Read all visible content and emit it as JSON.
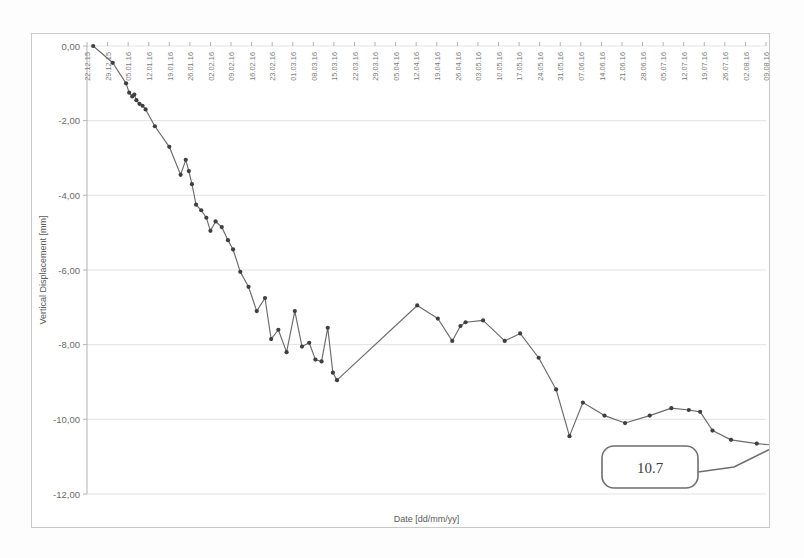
{
  "chart_data": {
    "type": "line",
    "title": "",
    "xlabel": "Date [dd/mm/yy]",
    "ylabel": "Vertical Displacement [mm]",
    "ylim": [
      -12.0,
      0.0
    ],
    "ytick_labels": [
      "0,00",
      "-2,00",
      "-4,00",
      "-6,00",
      "-8,00",
      "-10,00",
      "-12,00"
    ],
    "ytick_values": [
      0.0,
      -2.0,
      -4.0,
      -6.0,
      -8.0,
      -10.0,
      -12.0
    ],
    "grid": true,
    "legend": null,
    "xtick_labels": [
      "22.12.15",
      "29.12.15",
      "05.01.16",
      "12.01.16",
      "19.01.16",
      "26.01.16",
      "02.02.16",
      "09.02.16",
      "16.02.16",
      "23.02.16",
      "01.03.16",
      "08.03.16",
      "15.03.16",
      "22.03.16",
      "29.03.16",
      "05.04.16",
      "12.04.16",
      "19.04.16",
      "26.04.16",
      "03.05.16",
      "10.05.16",
      "17.05.16",
      "24.05.16",
      "31.05.16",
      "07.06.16",
      "14.06.16",
      "21.06.16",
      "28.06.16",
      "05.07.16",
      "12.07.16",
      "19.07.16",
      "26.07.16",
      "02.08.16",
      "09.08.16"
    ],
    "series": [
      {
        "name": "Vertical Displacement",
        "x": [
          0.3,
          1.25,
          1.9,
          2.05,
          2.2,
          2.3,
          2.4,
          2.55,
          2.7,
          2.85,
          3.3,
          4.0,
          4.55,
          4.8,
          4.95,
          5.1,
          5.3,
          5.55,
          5.8,
          6.0,
          6.25,
          6.55,
          6.85,
          7.1,
          7.45,
          7.85,
          8.25,
          8.65,
          8.95,
          9.3,
          9.7,
          10.1,
          10.45,
          10.8,
          11.1,
          11.4,
          11.7,
          11.95,
          12.15,
          16.05,
          17.05,
          17.75,
          18.15,
          18.4,
          19.25,
          20.3,
          21.05,
          21.95,
          22.8,
          23.45,
          24.1,
          25.15,
          26.15,
          27.35,
          28.4,
          29.25,
          29.8,
          30.4,
          31.3,
          32.55,
          33.55
        ],
        "values": [
          0.0,
          -0.45,
          -1.0,
          -1.25,
          -1.35,
          -1.3,
          -1.45,
          -1.55,
          -1.6,
          -1.7,
          -2.15,
          -2.7,
          -3.45,
          -3.05,
          -3.35,
          -3.7,
          -4.25,
          -4.4,
          -4.6,
          -4.95,
          -4.7,
          -4.85,
          -5.2,
          -5.45,
          -6.05,
          -6.45,
          -7.1,
          -6.75,
          -7.85,
          -7.6,
          -8.2,
          -7.1,
          -8.05,
          -7.95,
          -8.4,
          -8.45,
          -7.55,
          -8.75,
          -8.95,
          -6.95,
          -7.3,
          -7.9,
          -7.5,
          -7.4,
          -7.35,
          -7.9,
          -7.7,
          -8.35,
          -9.2,
          -10.45,
          -9.55,
          -9.9,
          -10.1,
          -9.9,
          -9.7,
          -9.75,
          -9.8,
          -10.3,
          -10.55,
          -10.65,
          -10.7
        ]
      }
    ],
    "annotations": [
      {
        "label": "10.7",
        "target_x": 33.55,
        "target_y": -10.7
      }
    ]
  }
}
